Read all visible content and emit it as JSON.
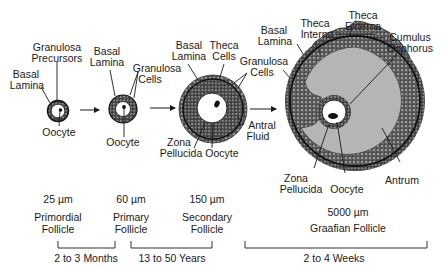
{
  "diagram": {
    "type": "ovarian follicle development",
    "stages": [
      {
        "id": "primordial",
        "size": "25 µm",
        "name_line1": "Primordial",
        "name_line2": "Follicle"
      },
      {
        "id": "primary",
        "size": "60 µm",
        "name_line1": "Primary",
        "name_line2": "Follicle"
      },
      {
        "id": "secondary",
        "size": "150 µm",
        "name_line1": "Secondary",
        "name_line2": "Follicle"
      },
      {
        "id": "graafian",
        "size": "5000 µm",
        "name_line1": "Graafian Follicle",
        "name_line2": ""
      }
    ],
    "durations": [
      {
        "label": "2 to 3 Months"
      },
      {
        "label": "13 to 50 Years"
      },
      {
        "label": "2 to 4 Weeks"
      }
    ],
    "labels": {
      "primordial": {
        "granulosa_precursors_1": "Granulosa",
        "granulosa_precursors_2": "Precursors",
        "basal_lamina_1": "Basal",
        "basal_lamina_2": "Lamina",
        "oocyte": "Oocyte"
      },
      "primary": {
        "basal_lamina_1": "Basal",
        "basal_lamina_2": "Lamina",
        "granulosa_cells_1": "Granulosa",
        "granulosa_cells_2": "Cells",
        "oocyte": "Oocyte"
      },
      "secondary": {
        "basal_lamina_1": "Basal",
        "basal_lamina_2": "Lamina",
        "theca_cells_1": "Theca",
        "theca_cells_2": "Cells",
        "granulosa_cells_1": "Granulosa",
        "granulosa_cells_2": "Cells",
        "zona_pellucida_1": "Zona",
        "zona_pellucida_2": "Pellucida",
        "oocyte": "Oocyte",
        "antral_fluid_1": "Antral",
        "antral_fluid_2": "Fluid"
      },
      "graafian": {
        "basal_lamina_1": "Basal",
        "basal_lamina_2": "Lamina",
        "theca_interna_1": "Theca",
        "theca_interna_2": "Interna",
        "theca_externa_1": "Theca",
        "theca_externa_2": "Externa",
        "cumulus_oophorus_1": "Cumulus",
        "cumulus_oophorus_2": "Oophorus",
        "zona_pellucida_1": "Zona",
        "zona_pellucida_2": "Pellucida",
        "oocyte": "Oocyte",
        "antrum": "Antrum"
      }
    },
    "colors": {
      "ink": "#1a1a1a",
      "cell_layer": "#6e6e6e",
      "antrum": "#b5b5b5",
      "background": "#ffffff"
    }
  }
}
